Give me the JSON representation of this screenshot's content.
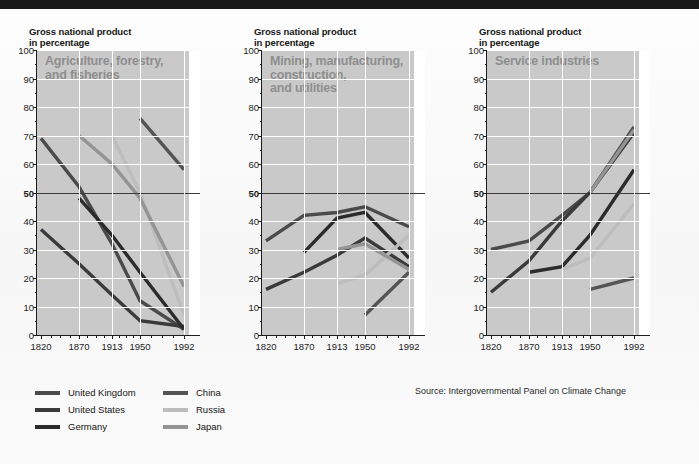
{
  "source_note": "Source: Intergovernmental Panel on Climate Change",
  "axis": {
    "y_title": "Gross national product\nin percentage",
    "y_ticks": [
      0,
      10,
      20,
      30,
      40,
      50,
      60,
      70,
      80,
      90,
      100
    ],
    "y_emphasis": 50,
    "x_ticks": [
      "1820",
      "1870",
      "1913",
      "1950",
      "1992"
    ],
    "y_min": 0,
    "y_max": 100
  },
  "colors": {
    "united_kingdom": "#4a4a4a",
    "united_states": "#3a3a3a",
    "germany": "#2b2b2b",
    "china": "#545454",
    "russia": "#bdbdbd",
    "japan": "#949494",
    "shade": "#c9c9c9",
    "grid": "#ffffff",
    "axis": "#1c1c1c",
    "panel_title": "#8e8e8e"
  },
  "legend": {
    "items": [
      {
        "label": "United Kingdom",
        "color": "#4a4a4a",
        "col": 0,
        "row": 0
      },
      {
        "label": "United States",
        "color": "#3a3a3a",
        "col": 0,
        "row": 1
      },
      {
        "label": "Germany",
        "color": "#2b2b2b",
        "col": 0,
        "row": 2
      },
      {
        "label": "China",
        "color": "#545454",
        "col": 1,
        "row": 0
      },
      {
        "label": "Russia",
        "color": "#bdbdbd",
        "col": 1,
        "row": 1
      },
      {
        "label": "Japan",
        "color": "#949494",
        "col": 1,
        "row": 2
      }
    ]
  },
  "chart_data": [
    {
      "type": "line",
      "title": "Agriculture, forestry,\nand fisheries",
      "xlabel": "",
      "ylabel": "Gross national product\nin percentage",
      "x": [
        "1820",
        "1870",
        "1913",
        "1950",
        "1992"
      ],
      "ylim": [
        0,
        100
      ],
      "grid": true,
      "legend_position": "below-left",
      "series": [
        {
          "name": "United Kingdom",
          "color": "#4a4a4a",
          "values": [
            69,
            52,
            32,
            12,
            2
          ]
        },
        {
          "name": "United States",
          "color": "#3a3a3a",
          "values": [
            37,
            25,
            14,
            5,
            3
          ]
        },
        {
          "name": "Germany",
          "color": "#2b2b2b",
          "values": [
            null,
            48,
            35,
            22,
            2
          ]
        },
        {
          "name": "China",
          "color": "#545454",
          "values": [
            null,
            null,
            null,
            76,
            58
          ]
        },
        {
          "name": "Russia",
          "color": "#bdbdbd",
          "values": [
            null,
            null,
            70,
            50,
            7
          ]
        },
        {
          "name": "Japan",
          "color": "#949494",
          "values": [
            null,
            70,
            60,
            48,
            17
          ]
        }
      ]
    },
    {
      "type": "line",
      "title": "Mining, manufacturing,\nconstruction,\nand utilities",
      "xlabel": "",
      "ylabel": "Gross national product\nin percentage",
      "x": [
        "1820",
        "1870",
        "1913",
        "1950",
        "1992"
      ],
      "ylim": [
        0,
        100
      ],
      "grid": true,
      "legend_position": "below-left",
      "series": [
        {
          "name": "United Kingdom",
          "color": "#4a4a4a",
          "values": [
            33,
            42,
            43,
            45,
            38
          ]
        },
        {
          "name": "United States",
          "color": "#3a3a3a",
          "values": [
            16,
            22,
            28,
            34,
            24
          ]
        },
        {
          "name": "Germany",
          "color": "#2b2b2b",
          "values": [
            null,
            29,
            41,
            43,
            27
          ]
        },
        {
          "name": "China",
          "color": "#545454",
          "values": [
            null,
            null,
            null,
            7,
            22
          ]
        },
        {
          "name": "Russia",
          "color": "#bdbdbd",
          "values": [
            null,
            null,
            18,
            21,
            35
          ]
        },
        {
          "name": "Japan",
          "color": "#949494",
          "values": [
            null,
            null,
            30,
            32,
            23
          ]
        }
      ]
    },
    {
      "type": "line",
      "title": "Service industries",
      "xlabel": "",
      "ylabel": "Gross national product\nin percentage",
      "x": [
        "1820",
        "1870",
        "1913",
        "1950",
        "1992"
      ],
      "ylim": [
        0,
        100
      ],
      "grid": true,
      "legend_position": "below-left",
      "series": [
        {
          "name": "United Kingdom",
          "color": "#4a4a4a",
          "values": [
            30,
            33,
            42,
            50,
            73
          ]
        },
        {
          "name": "United States",
          "color": "#3a3a3a",
          "values": [
            15,
            26,
            40,
            50,
            71
          ]
        },
        {
          "name": "Germany",
          "color": "#2b2b2b",
          "values": [
            null,
            22,
            24,
            35,
            58
          ]
        },
        {
          "name": "China",
          "color": "#545454",
          "values": [
            null,
            null,
            null,
            16,
            20
          ]
        },
        {
          "name": "Russia",
          "color": "#bdbdbd",
          "values": [
            null,
            null,
            23,
            27,
            46
          ]
        },
        {
          "name": "Japan",
          "color": "#949494",
          "values": [
            null,
            null,
            null,
            50,
            72
          ]
        }
      ]
    }
  ]
}
